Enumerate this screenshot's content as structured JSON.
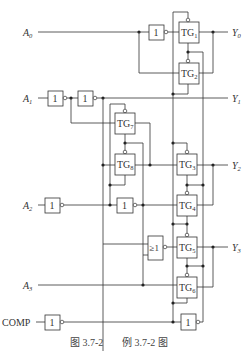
{
  "diagram": {
    "type": "logic-circuit",
    "inputs": [
      {
        "name": "A",
        "sub": "0"
      },
      {
        "name": "A",
        "sub": "1"
      },
      {
        "name": "A",
        "sub": "2"
      },
      {
        "name": "A",
        "sub": "3"
      },
      {
        "name": "COMP",
        "sub": ""
      }
    ],
    "outputs": [
      {
        "name": "Y",
        "sub": "0"
      },
      {
        "name": "Y",
        "sub": "1"
      },
      {
        "name": "Y",
        "sub": "2"
      },
      {
        "name": "Y",
        "sub": "3"
      }
    ],
    "transmission_gates": [
      {
        "label": "TG",
        "sub": "1"
      },
      {
        "label": "TG",
        "sub": "2"
      },
      {
        "label": "TG",
        "sub": "3"
      },
      {
        "label": "TG",
        "sub": "4"
      },
      {
        "label": "TG",
        "sub": "5"
      },
      {
        "label": "TG",
        "sub": "6"
      },
      {
        "label": "TG",
        "sub": "7"
      },
      {
        "label": "TG",
        "sub": "8"
      }
    ],
    "not_gate_label": "1",
    "or_gate_label": "≥1"
  },
  "caption": {
    "figure": "图 3.7-2",
    "title": "例 3.7-2 图"
  }
}
